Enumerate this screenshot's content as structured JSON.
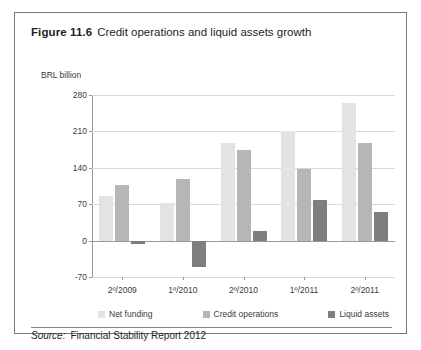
{
  "figure": {
    "label": "Figure 11.6",
    "caption": "Credit operations and liquid assets growth"
  },
  "source": {
    "prefix": "Source:",
    "text": "Financial Stability Report 2012"
  },
  "legend": {
    "position": "bottom",
    "items": [
      {
        "label": "Net funding",
        "color": "#e3e3e3"
      },
      {
        "label": "Credit operations",
        "color": "#b6b6b6"
      },
      {
        "label": "Liquid assets",
        "color": "#7e7e7e"
      }
    ]
  },
  "chart_data": {
    "type": "bar",
    "title": "Credit operations and liquid assets growth",
    "xlabel": "",
    "ylabel": "BRL billion",
    "ylim": [
      -70,
      280
    ],
    "yticks": [
      280,
      210,
      140,
      70,
      0,
      -70
    ],
    "ytick_labels": [
      "280",
      "210",
      "140",
      "70",
      "0",
      "-70"
    ],
    "grid": true,
    "categories": [
      "2º/2009",
      "1º/2010",
      "2º/2010",
      "1º/2011",
      "2º/2011"
    ],
    "series": [
      {
        "name": "Net funding",
        "color": "#e3e3e3",
        "values": [
          86,
          73,
          188,
          211,
          265
        ]
      },
      {
        "name": "Credit operations",
        "color": "#b6b6b6",
        "values": [
          106,
          118,
          175,
          137,
          187
        ]
      },
      {
        "name": "Liquid assets",
        "color": "#7e7e7e",
        "values": [
          -6,
          -50,
          18,
          78,
          55
        ]
      }
    ]
  }
}
